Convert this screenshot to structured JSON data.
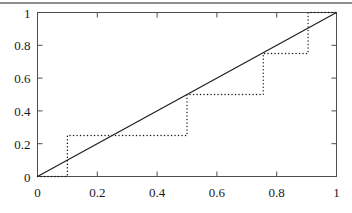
{
  "figure": {
    "top_rule": "horizontal-rule",
    "background_color": "#ffffff",
    "frame_color": "#4d4d4d"
  },
  "chart_data": {
    "type": "line",
    "title": "",
    "xlabel": "",
    "ylabel": "",
    "xlim": [
      0,
      1
    ],
    "ylim": [
      0,
      1
    ],
    "grid": false,
    "legend": "none",
    "xticks": [
      0,
      0.2,
      0.4,
      0.6,
      0.8,
      1
    ],
    "xtick_labels": [
      "0",
      "0.2",
      "0.4",
      "0.6",
      "0.8",
      "1"
    ],
    "yticks": [
      0,
      0.2,
      0.4,
      0.6,
      0.8,
      1
    ],
    "ytick_labels": [
      "0",
      "0.2",
      "0.4",
      "0.6",
      "0.8",
      "1"
    ],
    "tick_direction": "in",
    "series": [
      {
        "name": "diagonal-reference-line",
        "style": "solid",
        "color": "#1a1a1a",
        "x": [
          0,
          1
        ],
        "values": [
          0,
          1
        ]
      },
      {
        "name": "empirical-step-function",
        "style": "dotted",
        "color": "#1a1a1a",
        "drawstyle": "steps-post",
        "x": [
          0,
          0.1,
          0.1,
          0.5,
          0.5,
          0.755,
          0.755,
          0.905,
          0.905,
          1
        ],
        "values": [
          0,
          0,
          0.25,
          0.25,
          0.5,
          0.5,
          0.75,
          0.75,
          1,
          1
        ],
        "jump_points": [
          {
            "x": 0.1,
            "from": 0,
            "to": 0.25
          },
          {
            "x": 0.5,
            "from": 0.25,
            "to": 0.5
          },
          {
            "x": 0.755,
            "from": 0.5,
            "to": 0.75
          },
          {
            "x": 0.905,
            "from": 0.75,
            "to": 1
          }
        ]
      }
    ]
  }
}
